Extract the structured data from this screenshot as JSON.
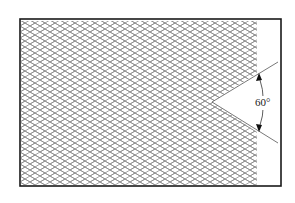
{
  "diagram": {
    "title": "",
    "angle_label": "60°",
    "elements": {
      "frame": "rectangular border",
      "hatch": "diamond crosshatch fill",
      "notch": "V-shaped notch cut from right edge of hatched area",
      "angle_dimension": "curved dimension arc with arrowheads at both ends"
    },
    "colors": {
      "frame": "#1a1a1a",
      "hatch": "#8a8a8a",
      "lines": "#555555",
      "background": "#ffffff"
    }
  }
}
